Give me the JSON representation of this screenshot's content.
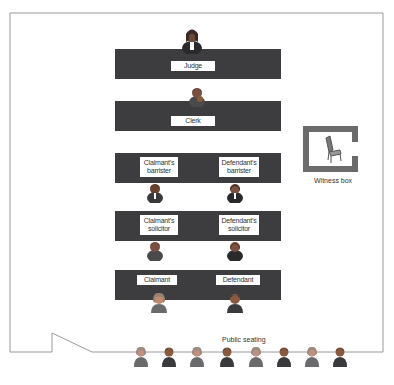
{
  "diagram": {
    "colors": {
      "bench": "#3d3d3f",
      "frame": "#9a9a9a",
      "witness_box": "#6b6b6b",
      "label_bg": "#ffffff"
    },
    "benches": [
      {
        "id": "judge",
        "labels": [
          "Judge"
        ]
      },
      {
        "id": "clerk",
        "labels": [
          "Clerk"
        ]
      },
      {
        "id": "barristers",
        "labels": [
          "Claimant's\nbarrister",
          "Defendant's\nbarrister"
        ]
      },
      {
        "id": "solicitors",
        "labels": [
          "Claimant's\nsolicitor",
          "Defendant's\nsolicitor"
        ]
      },
      {
        "id": "parties",
        "labels": [
          "Claimant",
          "Defendant"
        ]
      }
    ],
    "labels": {
      "judge": "Judge",
      "clerk": "Clerk",
      "claimant_barrister_1": "Claimant's",
      "claimant_barrister_2": "barrister",
      "defendant_barrister_1": "Defendant's",
      "defendant_barrister_2": "barrister",
      "claimant_solicitor_1": "Claimant's",
      "claimant_solicitor_2": "solicitor",
      "defendant_solicitor_1": "Defendant's",
      "defendant_solicitor_2": "solicitor",
      "claimant": "Claimant",
      "defendant": "Defendant",
      "witness_box": "Witness box",
      "public_seating": "Public seating"
    },
    "public_seating_count": 8,
    "icons": [
      "judge-person-icon",
      "clerk-person-icon",
      "barrister-person-icon",
      "solicitor-person-icon",
      "party-person-icon",
      "chair-icon",
      "public-person-icon"
    ]
  }
}
